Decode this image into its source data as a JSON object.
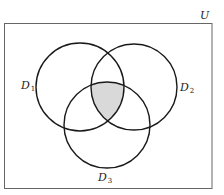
{
  "diagram": {
    "type": "venn",
    "universe": {
      "label": "U"
    },
    "sets": [
      {
        "name": "D",
        "sub": "1",
        "cx": 80,
        "cy": 87,
        "r": 44
      },
      {
        "name": "D",
        "sub": "2",
        "cx": 134,
        "cy": 87,
        "r": 43
      },
      {
        "name": "D",
        "sub": "3",
        "cx": 107,
        "cy": 125,
        "r": 43
      }
    ],
    "shaded_region": "D1 ∩ D2 ∩ D3",
    "colors": {
      "stroke": "#1a1a1a",
      "frame": "#555555",
      "shade": "#d9d9d9",
      "background": "#ffffff"
    }
  }
}
